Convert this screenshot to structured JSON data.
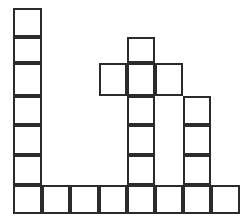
{
  "figure": {
    "name": "block-grid-figure",
    "background_color": "#ffffff",
    "cell_fill_color": "#ffffff",
    "cell_stroke_color": "#2b2b2b",
    "cell_stroke_width": 2,
    "grid": {
      "columns": 8,
      "rows": 7,
      "origin_x": 13,
      "origin_y": 8,
      "column_edges": [
        13,
        42,
        70,
        99,
        127,
        155,
        183,
        211,
        240
      ],
      "row_edges": [
        8,
        37,
        63,
        96,
        125,
        155,
        185,
        214
      ],
      "cell_width": 28.4,
      "cell_height": 29.4
    },
    "filled_cells": [
      {
        "col": 0,
        "row": 0
      },
      {
        "col": 0,
        "row": 1
      },
      {
        "col": 0,
        "row": 2
      },
      {
        "col": 0,
        "row": 3
      },
      {
        "col": 0,
        "row": 4
      },
      {
        "col": 0,
        "row": 5
      },
      {
        "col": 0,
        "row": 6
      },
      {
        "col": 1,
        "row": 6
      },
      {
        "col": 2,
        "row": 6
      },
      {
        "col": 3,
        "row": 2
      },
      {
        "col": 3,
        "row": 6
      },
      {
        "col": 4,
        "row": 1
      },
      {
        "col": 4,
        "row": 2
      },
      {
        "col": 4,
        "row": 3
      },
      {
        "col": 4,
        "row": 4
      },
      {
        "col": 4,
        "row": 5
      },
      {
        "col": 4,
        "row": 6
      },
      {
        "col": 5,
        "row": 2
      },
      {
        "col": 5,
        "row": 6
      },
      {
        "col": 6,
        "row": 3
      },
      {
        "col": 6,
        "row": 4
      },
      {
        "col": 6,
        "row": 5
      },
      {
        "col": 6,
        "row": 6
      },
      {
        "col": 7,
        "row": 6
      }
    ],
    "column_heights": [
      7,
      1,
      1,
      1,
      6,
      1,
      4,
      1
    ]
  },
  "chart_data": {
    "type": "bar",
    "title": "",
    "subtitle": "",
    "xlabel": "",
    "ylabel": "",
    "categories": [
      "1",
      "2",
      "3",
      "4",
      "5",
      "6",
      "7",
      "8"
    ],
    "values": [
      7,
      1,
      1,
      1,
      6,
      1,
      4,
      1
    ],
    "ylim": [
      0,
      7
    ],
    "grid": true,
    "legend": null,
    "annotations": [
      "Column 4 (index 3) has a detached cell at row 2, separate from its base cell at row 6",
      "Column 6 (index 5) has a detached cell at row 2, separate from its base cell at row 6"
    ],
    "detached_cells": [
      {
        "col": 3,
        "row": 2
      },
      {
        "col": 5,
        "row": 2
      }
    ]
  }
}
